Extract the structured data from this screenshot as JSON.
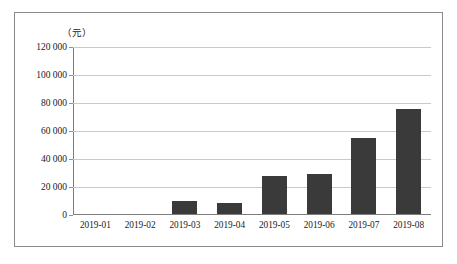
{
  "chart_data": {
    "type": "bar",
    "title": "",
    "subtitle": "",
    "unit_caption": "（元）",
    "xlabel": "",
    "ylabel": "",
    "categories": [
      "2019-01",
      "2019-02",
      "2019-03",
      "2019-04",
      "2019-05",
      "2019-06",
      "2019-07",
      "2019-08"
    ],
    "values": [
      0,
      0,
      9000,
      8000,
      27000,
      28500,
      54000,
      75000
    ],
    "ylim": [
      0,
      120000
    ],
    "yticks": [
      0,
      20000,
      40000,
      60000,
      80000,
      100000,
      120000
    ],
    "ytick_labels": [
      "0",
      "20 000",
      "40 000",
      "60 000",
      "80 000",
      "100 000",
      "120 000"
    ],
    "grid": true,
    "legend": false,
    "legend_position": "none",
    "bar_color": "#3a3a3a",
    "grid_color": "#c9c9c9",
    "axis_color": "#7d7d7d",
    "border_color": "#8a8a8a",
    "background_color": "#ffffff",
    "text_color": "#1a1a1a"
  }
}
